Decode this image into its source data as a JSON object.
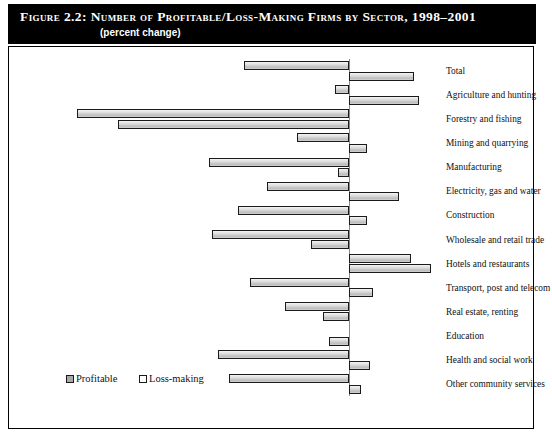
{
  "figure": {
    "title": "Figure 2.2:  Number of Profitable/Loss-Making Firms by Sector, 1998–2001",
    "subtitle": "(percent change)"
  },
  "legend": {
    "items": [
      {
        "label": "Profitable",
        "swatch": "filled"
      },
      {
        "label": "Loss-making",
        "swatch": "hollow"
      }
    ]
  },
  "chart_data": {
    "type": "bar",
    "orientation": "horizontal",
    "title": "Number of Profitable/Loss-Making Firms by Sector, 1998–2001",
    "subtitle": "(percent change)",
    "xlabel": "",
    "ylabel": "",
    "xlim": [
      -105,
      30
    ],
    "xticks": [
      -100,
      -80,
      -60,
      -40,
      -20,
      0,
      20
    ],
    "xticklabels": [
      "-100",
      "-80",
      "-60",
      "-40",
      "-20",
      "0",
      "20"
    ],
    "grid": false,
    "legend_position": "inside-lower-left",
    "categories": [
      "Total",
      "Agriculture and hunting",
      "Forestry and fishing",
      "Mining and quarrying",
      "Manufacturing",
      "Electricity, gas and water",
      "Construction",
      "Wholesale and retail trade",
      "Hotels and restaurants",
      "Transport, post and telecom",
      "Real estate, renting",
      "Education",
      "Health and social work",
      "Other community services"
    ],
    "series": [
      {
        "name": "Profitable",
        "values": [
          -36,
          -5,
          -93,
          -18,
          -48,
          -28,
          -38,
          -47,
          21,
          -34,
          -22,
          0,
          -45,
          -41
        ]
      },
      {
        "name": "Loss-making",
        "values": [
          22,
          24,
          -79,
          6,
          -4,
          17,
          6,
          -13,
          28,
          8,
          -9,
          -7,
          7,
          4
        ]
      }
    ]
  }
}
